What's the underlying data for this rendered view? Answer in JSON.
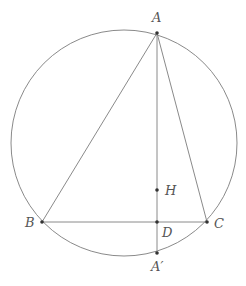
{
  "diagram": {
    "title": "",
    "circle": {
      "cx": 124,
      "cy": 143,
      "r": 113
    },
    "points": {
      "A": {
        "label": "A",
        "x": 157,
        "y": 33,
        "lx": 152,
        "ly": 22
      },
      "B": {
        "label": "B",
        "x": 42,
        "y": 222,
        "lx": 25,
        "ly": 227
      },
      "C": {
        "label": "C",
        "x": 207,
        "y": 222,
        "lx": 214,
        "ly": 228
      },
      "D": {
        "label": "D",
        "x": 157,
        "y": 222,
        "lx": 162,
        "ly": 237
      },
      "H": {
        "label": "H",
        "x": 157,
        "y": 190,
        "lx": 165,
        "ly": 195
      },
      "A_prime": {
        "label": "A′",
        "x": 157,
        "y": 253,
        "lx": 151,
        "ly": 271
      }
    },
    "segments": [
      {
        "name": "AB",
        "from": "A",
        "to": "B"
      },
      {
        "name": "AC",
        "from": "A",
        "to": "C"
      },
      {
        "name": "BC",
        "from": "B",
        "to": "C"
      },
      {
        "name": "AA_prime",
        "from": "A",
        "to": "A_prime"
      }
    ],
    "colors": {
      "line": "#8a8a8a",
      "point": "#333333",
      "label": "#555555"
    }
  }
}
